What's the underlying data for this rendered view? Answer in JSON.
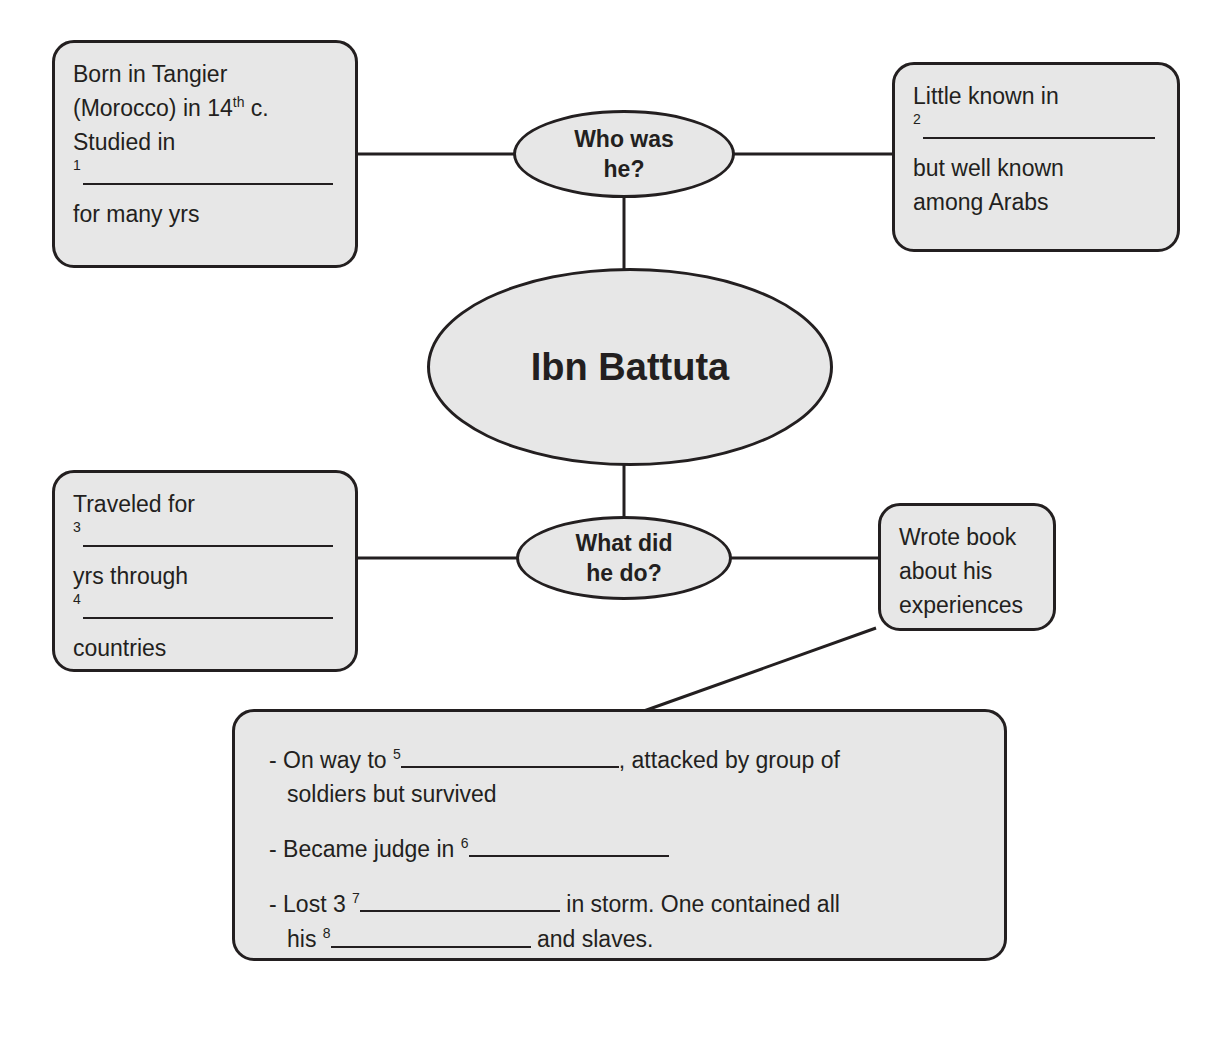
{
  "diagram": {
    "title": "Ibn Battuta",
    "center_node": {
      "label": "Ibn Battuta"
    },
    "question_nodes": [
      {
        "id": "who",
        "label_line1": "Who was",
        "label_line2": "he?"
      },
      {
        "id": "what",
        "label_line1": "What did",
        "label_line2": "he do?"
      }
    ],
    "boxes": {
      "born": {
        "line1": "Born in Tangier",
        "line2_a": "(Morocco) in 14",
        "line2_sup": "th",
        "line2_b": " c.",
        "line3": "Studied in",
        "blank_number": "1",
        "line4": "for many yrs"
      },
      "little_known": {
        "line1": "Little known in",
        "blank_number": "2",
        "line2": "but well known",
        "line3": "among Arabs"
      },
      "traveled": {
        "line1": "Traveled for",
        "blank_number_1": "3",
        "line2": "yrs through",
        "blank_number_2": "4",
        "line3": "countries"
      },
      "wrote_book": {
        "line1": "Wrote book",
        "line2": "about his",
        "line3": "experiences"
      },
      "details": {
        "bullets": [
          {
            "prefix": "- On way to ",
            "blank_number": "5",
            "suffix": ", attacked by group of",
            "second_line": "soldiers but survived"
          },
          {
            "prefix": "- Became judge in ",
            "blank_number": "6",
            "suffix": "",
            "second_line": ""
          },
          {
            "prefix": "- Lost 3 ",
            "blank_number": "7",
            "suffix": " in storm. One contained all",
            "second_line_prefix": "his ",
            "second_line_blank_number": "8",
            "second_line_suffix": " and slaves."
          }
        ]
      }
    },
    "colors": {
      "node_fill": "#e7e7e7",
      "stroke": "#231f20",
      "page_background": "#ffffff"
    }
  }
}
